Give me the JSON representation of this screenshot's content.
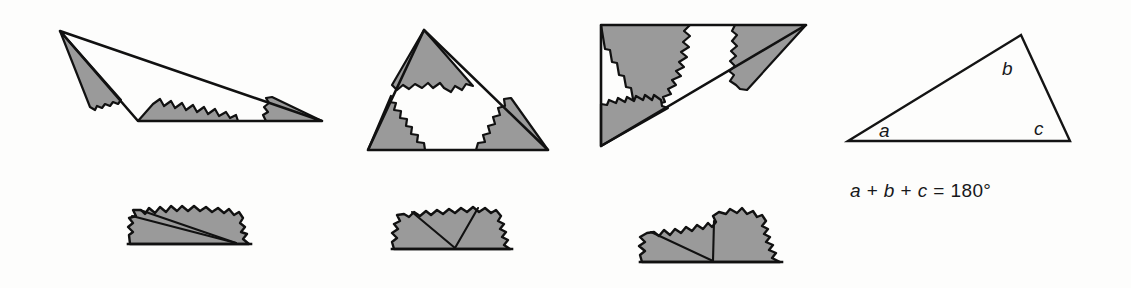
{
  "figure": {
    "kind": "geometry-illustration",
    "colors": {
      "background": "#fdfdfc",
      "shaded_fill": "#9a9a9a",
      "outline": "#111111",
      "text": "#17181a"
    },
    "stroke_widths": {
      "triangle_outline": 2.6,
      "torn_edge": 2.2,
      "angle_divider": 2.0
    }
  },
  "triangles": [
    {
      "id": "triangle-1",
      "name": "obtuse-scalene-triangle",
      "vertices": [
        [
          60,
          31
        ],
        [
          138,
          121
        ],
        [
          322,
          121
        ]
      ],
      "shaded_corners": 3
    },
    {
      "id": "triangle-2",
      "name": "isosceles-triangle",
      "vertices": [
        [
          424,
          30
        ],
        [
          368,
          150
        ],
        [
          548,
          150
        ]
      ],
      "shaded_corners": 3
    },
    {
      "id": "triangle-3",
      "name": "right-triangle",
      "vertices": [
        [
          601,
          25
        ],
        [
          806,
          25
        ],
        [
          601,
          146
        ]
      ],
      "shaded_corners": 3
    }
  ],
  "rearranged_strips": [
    {
      "id": "strip-1",
      "name": "angles-on-a-line-1",
      "baseline_y": 245,
      "x_range": [
        128,
        252
      ],
      "vertex": [
        236,
        244
      ],
      "pieces": 3
    },
    {
      "id": "strip-2",
      "name": "angles-on-a-line-2",
      "baseline_y": 250,
      "x_range": [
        392,
        522
      ],
      "vertex": [
        455,
        249
      ],
      "pieces": 3
    },
    {
      "id": "strip-3",
      "name": "angles-on-a-line-3",
      "baseline_y": 263,
      "x_range": [
        640,
        792
      ],
      "vertex": [
        713,
        262
      ],
      "pieces": 3
    }
  ],
  "labelled_triangle": {
    "id": "triangle-labelled",
    "name": "labelled-triangle",
    "vertices": [
      [
        848,
        141
      ],
      [
        1021,
        35
      ],
      [
        1070,
        141
      ]
    ],
    "labels": [
      {
        "id": "angle-a",
        "text": "a",
        "x": 879,
        "y": 120
      },
      {
        "id": "angle-b",
        "text": "b",
        "x": 1002,
        "y": 58
      },
      {
        "id": "angle-c",
        "text": "c",
        "x": 1034,
        "y": 118
      }
    ]
  },
  "equation": {
    "id": "angle-sum-equation",
    "full_text": "a + b + c = 180°",
    "terms": {
      "a": "a",
      "plus_1": "+",
      "b": "b",
      "plus_2": "+",
      "c": "c",
      "equals": "=",
      "value": "180°"
    }
  }
}
